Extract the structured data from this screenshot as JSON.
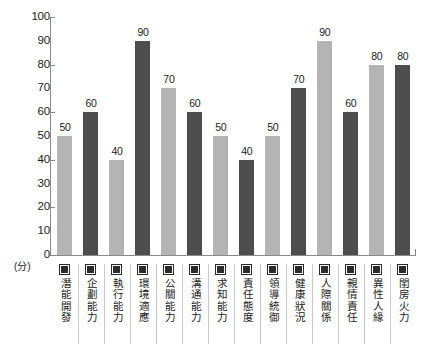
{
  "chart_data": {
    "type": "bar",
    "title": "",
    "xlabel": "",
    "ylabel": "(分)",
    "ylim": [
      0,
      100
    ],
    "grid": false,
    "legend_position": "none",
    "y_ticks": [
      {
        "value": 100,
        "label": "100",
        "major": true
      },
      {
        "value": 90,
        "label": "90",
        "major": false
      },
      {
        "value": 80,
        "label": "80",
        "major": true
      },
      {
        "value": 70,
        "label": "70",
        "major": false
      },
      {
        "value": 60,
        "label": "60",
        "major": true
      },
      {
        "value": 50,
        "label": "50",
        "major": false
      },
      {
        "value": 40,
        "label": "40",
        "major": true
      },
      {
        "value": 30,
        "label": "30",
        "major": false
      },
      {
        "value": 20,
        "label": "20",
        "major": true
      },
      {
        "value": 10,
        "label": "10",
        "major": false
      },
      {
        "value": 0,
        "label": "0",
        "major": true
      }
    ],
    "categories": [
      "潛能開發",
      "企劃能力",
      "執行能力",
      "環境適應",
      "公關能力",
      "溝通能力",
      "求知能力",
      "責任態度",
      "領導統御",
      "健康狀況",
      "人際關係",
      "親情責任",
      "異性人緣",
      "閨房火力"
    ],
    "values": [
      50,
      60,
      40,
      90,
      70,
      60,
      50,
      40,
      50,
      70,
      90,
      60,
      80,
      80
    ],
    "value_labels": [
      "50",
      "60",
      "40",
      "90",
      "70",
      "60",
      "50",
      "40",
      "50",
      "70",
      "90",
      "60",
      "80",
      "80"
    ],
    "bar_styles": [
      "light",
      "dark",
      "light",
      "dark",
      "light",
      "dark",
      "light",
      "dark",
      "light",
      "dark",
      "light",
      "dark",
      "light",
      "dark"
    ],
    "colors": {
      "light_bar": "#b4b4b4",
      "dark_bar": "#4d4d4d",
      "axis": "#8a8a8a",
      "text": "#1c1c1c",
      "background": "#ffffff",
      "divider": "#c9c9c9",
      "swatch": "#2b2b2b"
    }
  }
}
